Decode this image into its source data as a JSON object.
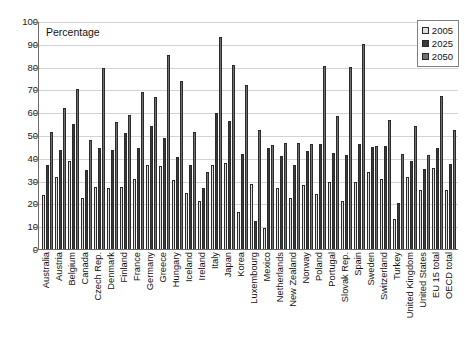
{
  "chart_data": {
    "type": "bar",
    "title": "Percentage",
    "xlabel": "",
    "ylabel": "",
    "ylim": [
      0,
      100
    ],
    "ytick_step": 10,
    "yticks": [
      0,
      10,
      20,
      30,
      40,
      50,
      60,
      70,
      80,
      90,
      100
    ],
    "grid": true,
    "legend_position": "top-right",
    "categories": [
      "Australia",
      "Austria",
      "Belgium",
      "Canada",
      "Czech Rep.",
      "Denmark",
      "Finland",
      "France",
      "Germany",
      "Greece",
      "Hungary",
      "Iceland",
      "Ireland",
      "Italy",
      "Japan",
      "Korea",
      "Luxembourg",
      "Mexico",
      "Netherlands",
      "New Zealand",
      "Norway",
      "Poland",
      "Portugal",
      "Slovak Rep.",
      "Spain",
      "Sweden",
      "Switzerland",
      "Turkey",
      "United Kingdom",
      "United States",
      "EU 15 total",
      "OECD total"
    ],
    "series": [
      {
        "name": "2005",
        "color": "#e0e0e0",
        "values": [
          23.5,
          31.8,
          38.8,
          22.5,
          27.0,
          26.9,
          27.1,
          30.8,
          36.7,
          36.6,
          30.1,
          24.4,
          21.0,
          36.8,
          37.6,
          16.4,
          28.5,
          9.0,
          26.9,
          22.5,
          28.1,
          24.0,
          29.3,
          21.0,
          29.6,
          33.9,
          30.6,
          13.0,
          31.6,
          25.9,
          35.6,
          25.7
        ]
      },
      {
        "name": "2025",
        "color": "#3a3a3a",
        "values": [
          36.9,
          43.5,
          54.7,
          34.7,
          44.2,
          43.6,
          51.0,
          44.2,
          53.9,
          48.9,
          40.5,
          36.8,
          26.8,
          59.6,
          56.2,
          41.7,
          12.1,
          44.5,
          40.8,
          36.7,
          42.9,
          46.0,
          41.9,
          41.3,
          46.2,
          44.8,
          45.0,
          20.3,
          38.8,
          34.9,
          44.3,
          37.5
        ]
      },
      {
        "name": "2050",
        "color": "#707070",
        "values": [
          51.5,
          62.0,
          70.0,
          48.0,
          79.5,
          55.5,
          58.6,
          68.8,
          66.8,
          85.0,
          73.8,
          51.4,
          33.6,
          93.0,
          80.6,
          71.8,
          52.0,
          45.5,
          46.7,
          46.4,
          45.9,
          80.2,
          58.2,
          80.0,
          90.0,
          45.4,
          56.7,
          41.6,
          54.0,
          41.4,
          67.3,
          52.3
        ]
      }
    ]
  },
  "legend": {
    "items": [
      {
        "label": "2005"
      },
      {
        "label": "2025"
      },
      {
        "label": "2050"
      }
    ]
  }
}
